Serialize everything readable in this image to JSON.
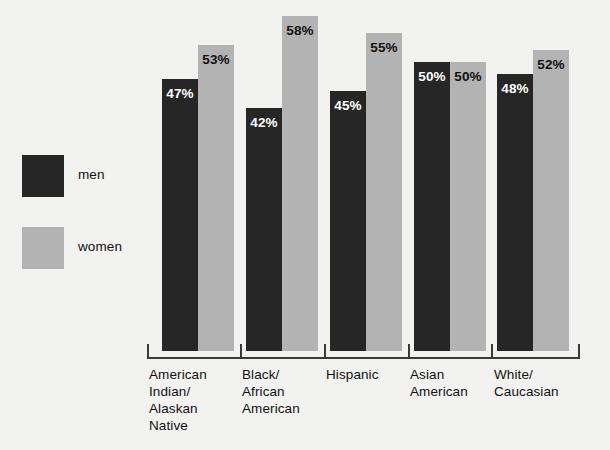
{
  "chart_data": {
    "type": "bar",
    "title": "",
    "subtitle": "",
    "xlabel": "",
    "ylabel": "",
    "ylim": [
      0,
      60
    ],
    "grid": false,
    "legend_position": "left",
    "value_suffix": "%",
    "categories": [
      "American\nIndian/\nAlaskan\nNative",
      "Black/\nAfrican\nAmerican",
      "Hispanic",
      "Asian\nAmerican",
      "White/\nCaucasian"
    ],
    "series": [
      {
        "name": "men",
        "color": "#262626",
        "values": [
          47,
          42,
          45,
          50,
          48
        ]
      },
      {
        "name": "women",
        "color": "#b3b3b3",
        "values": [
          53,
          58,
          55,
          50,
          52
        ]
      }
    ],
    "data_labels": [
      [
        "47%",
        "42%",
        "45%",
        "50%",
        "48%"
      ],
      [
        "53%",
        "58%",
        "55%",
        "50%",
        "52%"
      ]
    ]
  },
  "legend": {
    "items": [
      {
        "label": "men",
        "color": "#262626"
      },
      {
        "label": "women",
        "color": "#b3b3b3"
      }
    ]
  },
  "colors": {
    "background": "#f2f2f0",
    "men": "#262626",
    "women": "#b3b3b3",
    "axis": "#3a3a3a",
    "text": "#111111"
  }
}
